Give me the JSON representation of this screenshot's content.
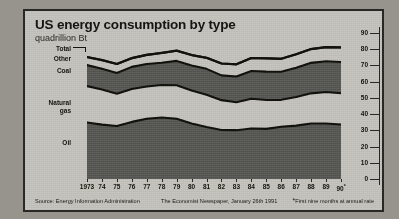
{
  "chart_data": {
    "type": "area",
    "title": "US energy consumption by type",
    "subtitle": "quadrillion Btu",
    "xlabel": "",
    "ylabel": "quadrillion Btu",
    "stacked": true,
    "grid": false,
    "legend_position": "inline-left-labels",
    "ylim": [
      0,
      90
    ],
    "yticks": [
      0,
      10,
      20,
      30,
      40,
      50,
      60,
      70,
      80,
      90
    ],
    "categories": [
      "1973",
      "74",
      "75",
      "76",
      "77",
      "78",
      "79",
      "80",
      "81",
      "82",
      "83",
      "84",
      "85",
      "86",
      "87",
      "88",
      "89",
      "90*"
    ],
    "x_values": [
      1973,
      1974,
      1975,
      1976,
      1977,
      1978,
      1979,
      1980,
      1981,
      1982,
      1983,
      1984,
      1985,
      1986,
      1987,
      1988,
      1989,
      1990
    ],
    "series": [
      {
        "name": "Oil",
        "values": [
          34.8,
          33.5,
          32.7,
          35.2,
          37.1,
          37.9,
          37.1,
          34.2,
          32.0,
          30.2,
          30.1,
          31.1,
          30.9,
          32.2,
          32.9,
          34.2,
          34.2,
          33.6
        ]
      },
      {
        "name": "Natural gas",
        "values": [
          22.5,
          21.7,
          19.9,
          20.3,
          19.9,
          20.0,
          20.7,
          20.4,
          19.9,
          18.4,
          17.2,
          18.4,
          17.8,
          16.6,
          17.7,
          18.6,
          19.4,
          19.3
        ]
      },
      {
        "name": "Coal",
        "values": [
          12.9,
          12.7,
          12.7,
          13.6,
          13.9,
          13.8,
          15.0,
          15.4,
          16.0,
          15.3,
          15.9,
          17.1,
          17.5,
          17.3,
          18.0,
          18.8,
          19.0,
          19.2
        ]
      },
      {
        "name": "Other",
        "values": [
          5.0,
          5.4,
          5.6,
          5.4,
          5.6,
          6.0,
          6.3,
          6.4,
          6.8,
          7.3,
          7.5,
          8.0,
          8.2,
          8.0,
          8.3,
          8.5,
          8.7,
          9.0
        ]
      }
    ],
    "total": {
      "name": "Total",
      "values": [
        75.2,
        73.3,
        70.9,
        74.5,
        76.5,
        77.7,
        79.1,
        76.4,
        74.7,
        71.2,
        70.7,
        74.6,
        74.4,
        74.1,
        76.9,
        80.1,
        81.3,
        81.1
      ]
    },
    "annotations": {
      "footnote_marker": "*",
      "footnote_text": "First nine months at annual rate"
    }
  },
  "labels": {
    "total": "Total",
    "other": "Other",
    "coal": "Coal",
    "natural_gas": "Natural\ngas",
    "oil": "Oil"
  },
  "footer": {
    "source": "Source: Energy Information Administration",
    "publication": "The Economist Newspaper, January 26th 1991",
    "footnote": "First nine months at annual rate",
    "footnote_star": "*"
  },
  "colors": {
    "panel_background": "#c2c0ba",
    "page_background": "#97938d",
    "dark_band": "#5a5a56",
    "light_band": "#c2c0ba",
    "line": "#14140f",
    "border": "#2a2a28"
  }
}
